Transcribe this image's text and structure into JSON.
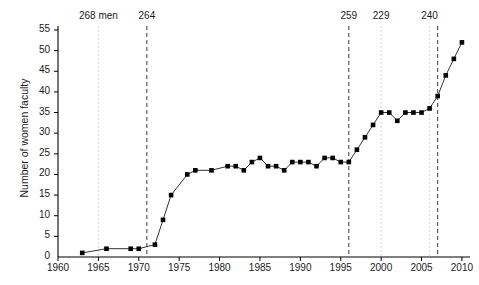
{
  "chart_data": {
    "type": "line",
    "title": "",
    "xlabel": "",
    "ylabel": "Number of women faculty",
    "xlim": [
      1960,
      2011
    ],
    "ylim": [
      0,
      55
    ],
    "xticks": [
      1960,
      1965,
      1970,
      1975,
      1980,
      1985,
      1990,
      1995,
      2000,
      2005,
      2010
    ],
    "yticks": [
      0,
      5,
      10,
      15,
      20,
      25,
      30,
      35,
      40,
      45,
      50,
      55
    ],
    "grid": false,
    "legend": null,
    "marker": "square",
    "marker_color": "#000000",
    "line_color": "#333333",
    "x": [
      1963,
      1966,
      1969,
      1970,
      1972,
      1973,
      1974,
      1976,
      1977,
      1979,
      1981,
      1982,
      1983,
      1984,
      1985,
      1986,
      1987,
      1988,
      1989,
      1990,
      1991,
      1992,
      1993,
      1994,
      1995,
      1996,
      1997,
      1998,
      1999,
      2000,
      2001,
      2002,
      2003,
      2004,
      2005,
      2006,
      2007,
      2008,
      2009,
      2010
    ],
    "values": [
      1,
      2,
      2,
      2,
      3,
      9,
      15,
      20,
      21,
      21,
      22,
      22,
      21,
      23,
      24,
      22,
      22,
      21,
      23,
      23,
      23,
      22,
      24,
      24,
      23,
      23,
      26,
      29,
      32,
      35,
      35,
      33,
      35,
      35,
      35,
      36,
      39,
      44,
      48,
      52
    ],
    "annotations": [
      {
        "label": "268 men",
        "x": 1965,
        "style": "dotted-light"
      },
      {
        "label": "264",
        "x": 1971,
        "style": "dashed-dark"
      },
      {
        "label": "259",
        "x": 1996,
        "style": "dashed-dark"
      },
      {
        "label": "229",
        "x": 2000,
        "style": "dotted-light"
      },
      {
        "label": "240",
        "x": 2006,
        "style": "dotted-light"
      },
      {
        "label": "",
        "x": 2007,
        "style": "dashed-dark"
      }
    ]
  }
}
